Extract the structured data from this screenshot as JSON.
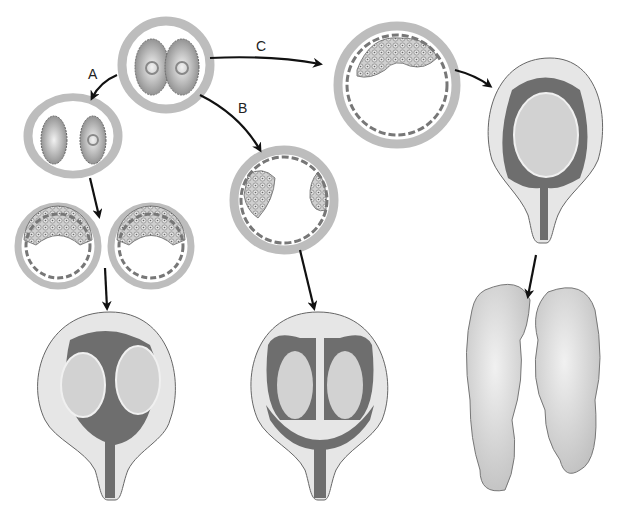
{
  "diagram": {
    "labels": {
      "path_a": "A",
      "path_b": "B",
      "path_c": "C"
    },
    "stages": [
      {
        "id": "two-cell-embryo",
        "description": "two-cell stage in zona pellucida"
      },
      {
        "id": "separated-blastomeres",
        "description": "two separated blastomeres (path A)"
      },
      {
        "id": "two-blastocysts",
        "description": "two separate blastocysts"
      },
      {
        "id": "dichorionic-uterus",
        "description": "uterus with two separate chorions/amnions"
      },
      {
        "id": "blastocyst-two-icm",
        "description": "blastocyst with two inner cell masses (path B)"
      },
      {
        "id": "monochorionic-diamniotic-uterus",
        "description": "uterus with shared chorion, two amnions"
      },
      {
        "id": "blastocyst-single-icm",
        "description": "blastocyst with single inner cell mass (path C)"
      },
      {
        "id": "monoamniotic-uterus",
        "description": "uterus with shared amnion"
      },
      {
        "id": "conjoined-twins",
        "description": "conjoined twins"
      }
    ],
    "colors": {
      "ring": "#bdbdbd",
      "dark_fluid": "#6e6e6e",
      "uterus_fill": "#e6e6e6",
      "fetus_fill": "#d2d2d2",
      "arrow": "#111111"
    }
  }
}
